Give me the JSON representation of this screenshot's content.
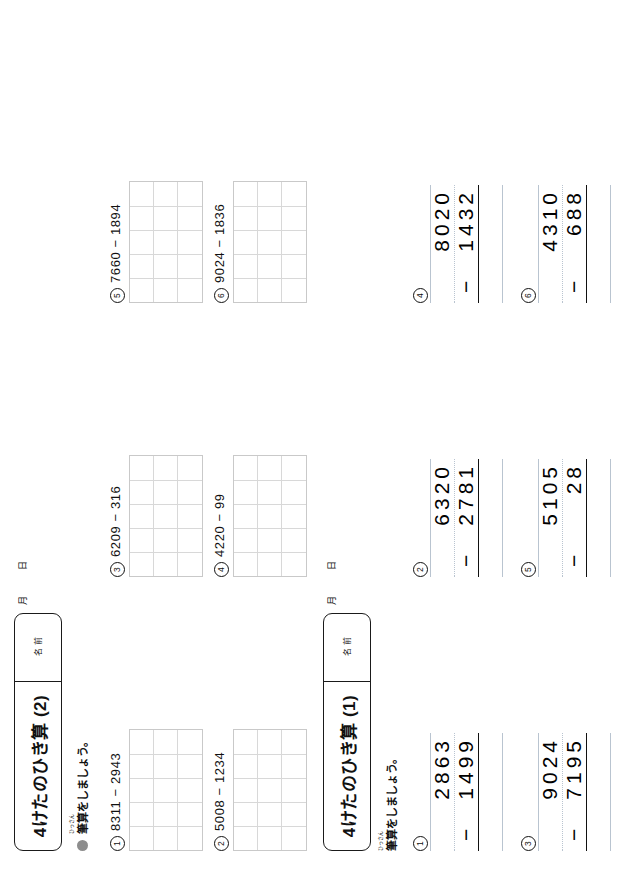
{
  "page": {
    "width": 618,
    "height": 887,
    "background": "#ffffff",
    "orientation": "rotated-90-ccw"
  },
  "worksheets": [
    {
      "id": "worksheet-2",
      "title": "4けたのひき算 (2)",
      "name_label_top": "名",
      "name_label_bottom": "前",
      "date_month": "月",
      "date_day": "日",
      "instruction": {
        "ruby": "ひっさん",
        "text": "筆算をしましょう。",
        "bullet_color": "#8d8d8d"
      },
      "type": "horizontal-with-answer-grid",
      "grid": {
        "cols": 5,
        "rows": 3,
        "border_color": "#c9c9c9",
        "inner_color": "#d8d8d8"
      },
      "problems": [
        {
          "number": "1",
          "minuend": "8311",
          "operator": "−",
          "subtrahend": "2943",
          "expression": "8311 − 2943"
        },
        {
          "number": "2",
          "minuend": "5008",
          "operator": "−",
          "subtrahend": "1234",
          "expression": "5008 − 1234"
        },
        {
          "number": "3",
          "minuend": "6209",
          "operator": "−",
          "subtrahend": "316",
          "expression": "6209 − 316"
        },
        {
          "number": "4",
          "minuend": "4220",
          "operator": "−",
          "subtrahend": "99",
          "expression": "4220 − 99"
        },
        {
          "number": "5",
          "minuend": "7660",
          "operator": "−",
          "subtrahend": "1894",
          "expression": "7660 − 1894"
        },
        {
          "number": "6",
          "minuend": "9024",
          "operator": "−",
          "subtrahend": "1836",
          "expression": "9024 − 1836"
        }
      ]
    },
    {
      "id": "worksheet-1",
      "title": "4けたのひき算 (1)",
      "name_label_top": "名",
      "name_label_bottom": "前",
      "date_month": "月",
      "date_day": "日",
      "instruction": {
        "ruby": "ひっさん",
        "text": "筆算をしましょう。",
        "bullet_color": "#ffffff"
      },
      "type": "vertical-column-subtraction",
      "rule_color": "#b9c4d0",
      "problems": [
        {
          "number": "1",
          "minuend": "2863",
          "operator": "−",
          "subtrahend": "1499"
        },
        {
          "number": "2",
          "minuend": "6320",
          "operator": "−",
          "subtrahend": "2781"
        },
        {
          "number": "3",
          "minuend": "9024",
          "operator": "−",
          "subtrahend": "7195"
        },
        {
          "number": "4",
          "minuend": "8020",
          "operator": "−",
          "subtrahend": "1432"
        },
        {
          "number": "5",
          "minuend": "5105",
          "operator": "−",
          "subtrahend": "28"
        },
        {
          "number": "6",
          "minuend": "4310",
          "operator": "−",
          "subtrahend": "688"
        }
      ]
    }
  ]
}
